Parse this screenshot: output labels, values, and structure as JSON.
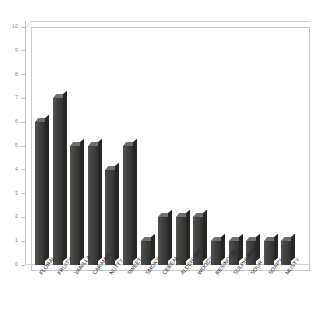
{
  "chart_data": {
    "type": "bar",
    "title": "",
    "subtitle": "",
    "xlabel": "",
    "ylabel": "",
    "categories": [
      "FLORAL",
      "FRUITY",
      "VANILLA",
      "CARAMEL",
      "NUTTY",
      "SWEET",
      "SMOKY",
      "CEREAL",
      "ALDEHYDIC",
      "WOODY",
      "RESINOUS",
      "SULPHUROUS",
      "SOUR",
      "SOAPY",
      "MUSTY"
    ],
    "values": [
      6,
      7,
      5,
      5,
      4,
      5,
      1,
      2,
      2,
      2,
      1,
      1,
      1,
      1,
      1
    ],
    "ylim": [
      0,
      10
    ],
    "ytick_labels": [
      "0",
      "1",
      "2",
      "3",
      "4",
      "5",
      "6",
      "7",
      "8",
      "9",
      "10"
    ],
    "ytick_values": [
      0,
      1,
      2,
      3,
      4,
      5,
      6,
      7,
      8,
      9,
      10
    ],
    "grid": false,
    "legend": null,
    "style": "3d-column",
    "bar_color": "#41413f",
    "bar_top_color": "#6e6e6a",
    "bar_side_color": "#262625",
    "frame_color": "#c9c9c9",
    "tick_label_color": "#8a8a8a",
    "category_label_color": "#1e1e1e",
    "background_color": "#ffffff",
    "label_rotation_deg": -52
  }
}
